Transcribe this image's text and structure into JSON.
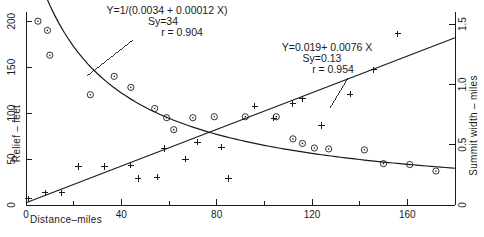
{
  "chart_data": {
    "type": "scatter",
    "title": "",
    "xlabel": "Distance–miles",
    "ylabel": "Relief – feet",
    "y2label": "Summit width – miles",
    "xlim": [
      0,
      180
    ],
    "ylim": [
      0,
      210
    ],
    "y2lim": [
      0,
      1.6
    ],
    "xticks": [
      0,
      40,
      80,
      120,
      160
    ],
    "xticklabels": [
      "0",
      "40",
      "80",
      "120",
      "160"
    ],
    "xminorticks": [
      20,
      60,
      100,
      140,
      180
    ],
    "yticks": [
      0,
      50,
      100,
      150,
      200
    ],
    "yticklabels": [
      "0",
      "50",
      "100",
      "150",
      "200"
    ],
    "y2ticks": [
      0,
      0.5,
      1.0,
      1.5
    ],
    "y2ticklabels": [
      "0",
      "0.5",
      "1.0",
      "1.5"
    ],
    "grid": false,
    "legend_position": "none",
    "series": [
      {
        "name": "Relief",
        "marker": "circle-dot",
        "axis": "left",
        "points": [
          [
            5,
            200
          ],
          [
            9,
            190
          ],
          [
            10,
            163
          ],
          [
            27,
            120
          ],
          [
            37,
            140
          ],
          [
            44,
            128
          ],
          [
            54,
            105
          ],
          [
            59,
            95
          ],
          [
            62,
            82
          ],
          [
            70,
            95
          ],
          [
            79,
            96
          ],
          [
            92,
            96
          ],
          [
            105,
            96
          ],
          [
            112,
            72
          ],
          [
            116,
            67
          ],
          [
            121,
            62
          ],
          [
            127,
            61
          ],
          [
            142,
            60
          ],
          [
            150,
            45
          ],
          [
            161,
            44
          ],
          [
            172,
            37
          ]
        ]
      },
      {
        "name": "Summit width",
        "marker": "plus",
        "axis": "right",
        "points": [
          [
            1,
            0.05
          ],
          [
            8,
            0.1
          ],
          [
            15,
            0.1
          ],
          [
            22,
            0.32
          ],
          [
            33,
            0.32
          ],
          [
            44,
            0.33
          ],
          [
            47,
            0.22
          ],
          [
            55,
            0.23
          ],
          [
            58,
            0.47
          ],
          [
            67,
            0.38
          ],
          [
            72,
            0.52
          ],
          [
            82,
            0.48
          ],
          [
            85,
            0.22
          ],
          [
            96,
            0.82
          ],
          [
            104,
            0.72
          ],
          [
            112,
            0.84
          ],
          [
            116,
            0.88
          ],
          [
            124,
            0.66
          ],
          [
            136,
            0.92
          ],
          [
            146,
            1.12
          ],
          [
            156,
            1.42
          ]
        ]
      }
    ],
    "fits": [
      {
        "name": "relief-fit",
        "axis": "left",
        "equation": "Y=1/(0.0034 + 0.00012 X)",
        "sy": "Sy=34",
        "r": "r = 0.904",
        "a": 0.0034,
        "b": 0.00012
      },
      {
        "name": "summit-width-fit",
        "axis": "right",
        "equation": "Y=0.019+ 0.0076 X",
        "sy": "Sy=0.13",
        "r": "r = 0.954",
        "intercept": 0.019,
        "slope": 0.0076
      }
    ]
  },
  "annotations": {
    "relief": {
      "line1": "Y=1/(0.0034 + 0.00012 X)",
      "line2": "Sy=34",
      "line3": "r = 0.904"
    },
    "summit": {
      "line1": "Y=0.019+ 0.0076 X",
      "line2": "Sy=0.13",
      "line3": "r = 0.954"
    }
  },
  "axes": {
    "x_title": "Distance–miles",
    "y_title": "Relief – feet",
    "y2_title": "Summit width – miles"
  },
  "colors": {
    "ink": "#1a1a1a",
    "background": "#ffffff"
  }
}
